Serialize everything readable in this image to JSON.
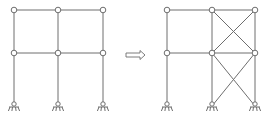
{
  "diagram": {
    "colors": {
      "line": "#6e6e6e",
      "node_fill": "#ffffff",
      "node_stroke": "#6e6e6e",
      "background": "#ffffff"
    },
    "rows_y": [
      10,
      53,
      106
    ],
    "left_frame": {
      "columns_x": [
        14,
        58,
        103
      ],
      "nodes": [
        [
          14,
          10
        ],
        [
          58,
          10
        ],
        [
          103,
          10
        ],
        [
          14,
          53
        ],
        [
          58,
          53
        ],
        [
          103,
          53
        ]
      ],
      "supports": [
        [
          14,
          106
        ],
        [
          58,
          106
        ],
        [
          103,
          106
        ]
      ]
    },
    "arrow": {
      "x1": 126,
      "x2": 145,
      "y": 55,
      "glyph": "double-arrow-right"
    },
    "right_frame": {
      "columns_x": [
        167,
        212,
        255
      ],
      "nodes": [
        [
          167,
          10
        ],
        [
          212,
          10
        ],
        [
          255,
          10
        ],
        [
          167,
          53
        ],
        [
          212,
          53
        ],
        [
          255,
          53
        ]
      ],
      "supports": [
        [
          167,
          106
        ],
        [
          212,
          106
        ],
        [
          255,
          106
        ]
      ],
      "braces": [
        [
          [
            212,
            10
          ],
          [
            255,
            53
          ]
        ],
        [
          [
            255,
            10
          ],
          [
            212,
            53
          ]
        ],
        [
          [
            212,
            53
          ],
          [
            255,
            106
          ]
        ],
        [
          [
            255,
            53
          ],
          [
            212,
            106
          ]
        ]
      ]
    }
  }
}
